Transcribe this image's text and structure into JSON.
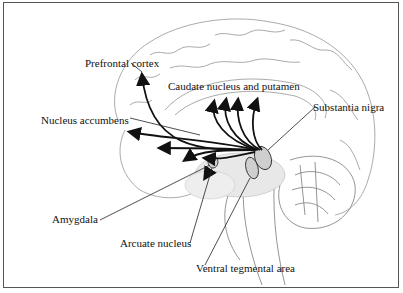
{
  "figure": {
    "labels": {
      "prefrontal_cortex": "Prefrontal cortex",
      "caudate_putamen": "Caudate nucleus and putamen",
      "substantia_nigra": "Substantia nigra",
      "nucleus_accumbens": "Nucleus accumbens",
      "amygdala": "Amygdala",
      "arcuate_nucleus": "Arcuate nucleus",
      "ventral_tegmental_area": "Ventral tegmental area"
    },
    "colors": {
      "line": "#111111",
      "sketch": "#9a9a9a",
      "stipple": "#bdbdbd",
      "border": "#555555"
    }
  }
}
